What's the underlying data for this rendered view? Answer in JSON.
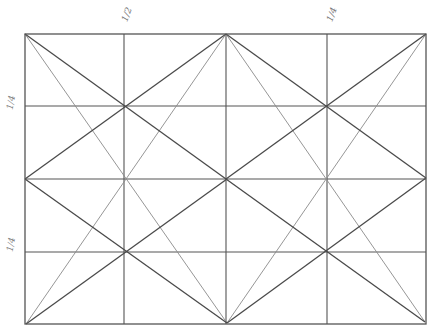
{
  "diagram": {
    "type": "geometric-grid-construction",
    "frame": {
      "x1": 25,
      "y1": 34,
      "x2": 426,
      "y2": 324
    },
    "grid": {
      "columns": 4,
      "rows": 4,
      "vertical_lines_x": [
        124,
        226,
        327
      ],
      "horizontal_lines_y": [
        106,
        179,
        252
      ]
    },
    "labels": {
      "top": [
        {
          "text": "1/2",
          "x": 120,
          "y": 10
        },
        {
          "text": "1/4",
          "x": 325,
          "y": 10
        }
      ],
      "left": [
        {
          "text": "1/4",
          "x": 4,
          "y": 98
        },
        {
          "text": "1/4",
          "x": 4,
          "y": 240
        }
      ]
    },
    "colors": {
      "dark_line": "#4a4a4a",
      "light_line": "#8a8a8a",
      "grid_line": "#555555",
      "background": "#ffffff"
    },
    "dark_lines": [
      [
        25,
        34,
        226,
        179
      ],
      [
        226,
        34,
        25,
        179
      ],
      [
        25,
        179,
        227,
        323
      ],
      [
        227,
        179,
        26,
        324
      ],
      [
        226,
        34,
        426,
        178
      ],
      [
        426,
        34,
        226,
        179
      ],
      [
        226,
        179,
        425,
        322
      ],
      [
        426,
        178,
        227,
        323
      ]
    ],
    "light_lines": [
      [
        25,
        34,
        227,
        323
      ],
      [
        226,
        34,
        26,
        324
      ],
      [
        226,
        34,
        425,
        322
      ],
      [
        426,
        34,
        227,
        323
      ]
    ]
  }
}
